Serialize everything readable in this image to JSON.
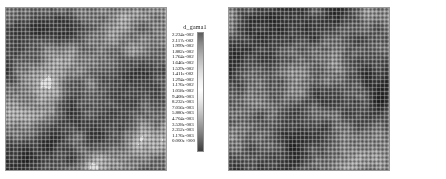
{
  "figure": {
    "background": "#ffffff",
    "width": 446,
    "height": 179
  },
  "panels": [
    {
      "id": "panel-left",
      "legend_title": "d_gama1",
      "legend_values": [
        "2.234e-002",
        "2.117e-002",
        "1.999e-002",
        "1.882e-002",
        "1.764e-002",
        "1.646e-002",
        "1.529e-002",
        "1.411e-002",
        "1.294e-002",
        "1.176e-002",
        "1.058e-002",
        "9.408e-003",
        "8.232e-003",
        "7.056e-003",
        "5.880e-003",
        "4.704e-003",
        "3.528e-003",
        "2.352e-003",
        "1.176e-003",
        "0.000e+000"
      ]
    },
    {
      "id": "panel-right",
      "legend_title": "d_gama2",
      "legend_values": [
        "2.136e-002",
        "2.024e-002",
        "1.912e-002",
        "1.799e-002",
        "1.687e-002",
        "1.574e-002",
        "1.462e-002",
        "1.349e-002",
        "1.237e-002",
        "1.124e-002",
        "1.012e-002",
        "8.993e-003",
        "7.871e-003",
        "6.747e-003",
        "5.622e-003",
        "4.497e-003",
        "3.373e-003",
        "2.248e-003",
        "1.124e-003",
        "0.000e+000"
      ]
    }
  ],
  "chart_data": [
    {
      "type": "heatmap",
      "title": "d_gama1",
      "xlabel": "",
      "ylabel": "",
      "legend_position": "right",
      "grid": true,
      "colormap": "grayscale",
      "vmin": 0.0,
      "vmax": 0.02234,
      "levels": [
        0.02234,
        0.02117,
        0.01999,
        0.01882,
        0.01764,
        0.01646,
        0.01529,
        0.01411,
        0.01294,
        0.01176,
        0.01058,
        0.009408,
        0.008232,
        0.007056,
        0.00588,
        0.004704,
        0.003528,
        0.002352,
        0.001176,
        0.0
      ],
      "tick_labels": [
        "2.234e-002",
        "2.117e-002",
        "1.999e-002",
        "1.882e-002",
        "1.764e-002",
        "1.646e-002",
        "1.529e-002",
        "1.411e-002",
        "1.294e-002",
        "1.176e-002",
        "1.058e-002",
        "9.408e-003",
        "8.232e-003",
        "7.056e-003",
        "5.880e-003",
        "4.704e-003",
        "3.528e-003",
        "2.352e-003",
        "1.176e-003",
        "0.000e+000"
      ]
    },
    {
      "type": "heatmap",
      "title": "d_gama2",
      "xlabel": "",
      "ylabel": "",
      "legend_position": "right",
      "grid": true,
      "colormap": "grayscale",
      "vmin": 0.0,
      "vmax": 0.02136,
      "levels": [
        0.02136,
        0.02024,
        0.01912,
        0.01799,
        0.01687,
        0.01574,
        0.01462,
        0.01349,
        0.01237,
        0.01124,
        0.01012,
        0.008993,
        0.007871,
        0.006747,
        0.005622,
        0.004497,
        0.003373,
        0.002248,
        0.001124,
        0.0
      ],
      "tick_labels": [
        "2.136e-002",
        "2.024e-002",
        "1.912e-002",
        "1.799e-002",
        "1.687e-002",
        "1.574e-002",
        "1.462e-002",
        "1.349e-002",
        "1.237e-002",
        "1.124e-002",
        "1.012e-002",
        "8.993e-003",
        "7.871e-003",
        "6.747e-003",
        "5.622e-003",
        "4.497e-003",
        "3.373e-003",
        "2.248e-003",
        "1.124e-003",
        "0.000e+000"
      ]
    }
  ]
}
